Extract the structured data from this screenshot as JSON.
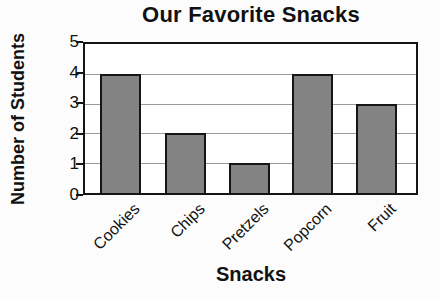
{
  "chart_data": {
    "type": "bar",
    "title": "Our Favorite Snacks",
    "xlabel": "Snacks",
    "ylabel": "Number of Students",
    "categories": [
      "Cookies",
      "Chips",
      "Pretzels",
      "Popcorn",
      "Fruit"
    ],
    "values": [
      4,
      2,
      1,
      4,
      3
    ],
    "yticks": [
      5,
      4,
      3,
      2,
      1,
      0
    ],
    "ylim": [
      0,
      5
    ],
    "grid": true,
    "legend": "none",
    "bar_color": "#838383",
    "bar_border_color": "#151515",
    "gridline_color": "#9b9b9b",
    "axis_color": "#151515"
  }
}
